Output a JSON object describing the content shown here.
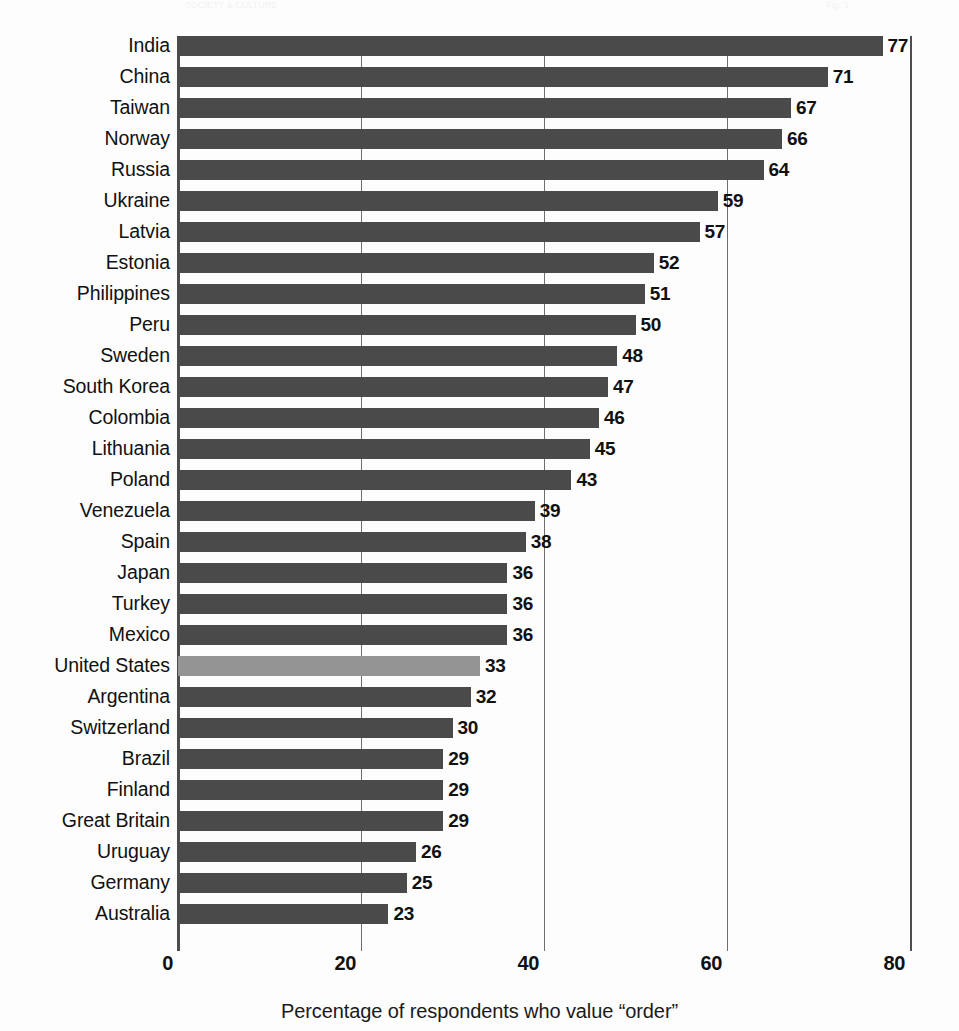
{
  "ghost": {
    "left_fragment": "SOCIETY & CULTURE",
    "right_fragment": "Fig. 1"
  },
  "chart_data": {
    "type": "bar",
    "orientation": "horizontal",
    "title": "",
    "subtitle": "",
    "xlabel": "Percentage of respondents who value “order”",
    "ylabel": "",
    "xlim": [
      0,
      80
    ],
    "xticks": [
      0,
      20,
      40,
      60,
      80
    ],
    "xtick_labels": [
      "0",
      "20",
      "40",
      "60",
      "80"
    ],
    "grid": true,
    "grid_axis": "x",
    "legend": "none",
    "highlight_category": "United States",
    "colors": {
      "bar": "#4a4a4a",
      "bar_highlight": "#949494",
      "axis": "#4d4d4d",
      "grid": "#6e6e6e",
      "text": "#111111",
      "background": "#fdfdfd"
    },
    "categories": [
      "India",
      "China",
      "Taiwan",
      "Norway",
      "Russia",
      "Ukraine",
      "Latvia",
      "Estonia",
      "Philippines",
      "Peru",
      "Sweden",
      "South Korea",
      "Colombia",
      "Lithuania",
      "Poland",
      "Venezuela",
      "Spain",
      "Japan",
      "Turkey",
      "Mexico",
      "United States",
      "Argentina",
      "Switzerland",
      "Brazil",
      "Finland",
      "Great Britain",
      "Uruguay",
      "Germany",
      "Australia"
    ],
    "values": [
      77,
      71,
      67,
      66,
      64,
      59,
      57,
      52,
      51,
      50,
      48,
      47,
      46,
      45,
      43,
      39,
      38,
      36,
      36,
      36,
      33,
      32,
      30,
      29,
      29,
      29,
      26,
      25,
      23
    ],
    "value_labels": [
      "77",
      "71",
      "67",
      "66",
      "64",
      "59",
      "57",
      "52",
      "51",
      "50",
      "48",
      "47",
      "46",
      "45",
      "43",
      "39",
      "38",
      "36",
      "36",
      "36",
      "33",
      "32",
      "30",
      "29",
      "29",
      "29",
      "26",
      "25",
      "23"
    ]
  }
}
